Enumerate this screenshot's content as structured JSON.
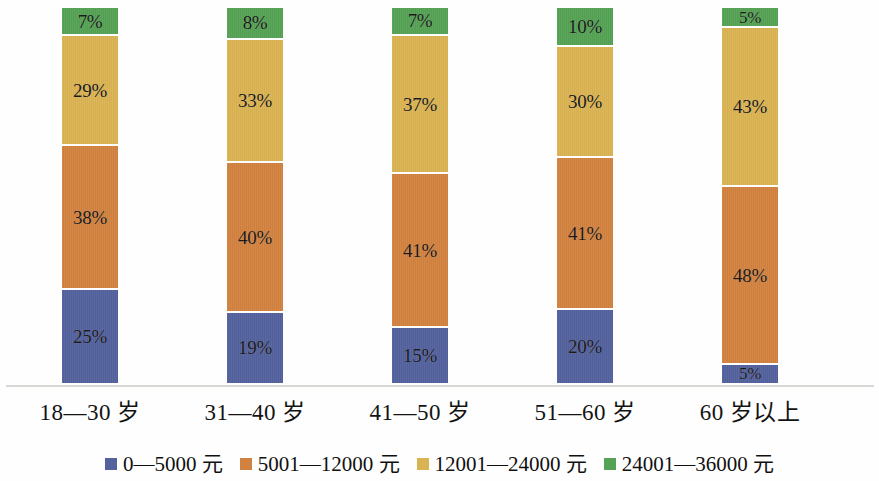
{
  "chart_data": {
    "type": "bar",
    "subtype": "stacked-bar-100",
    "title": "",
    "subtitle": "",
    "xlabel": "",
    "ylabel": "",
    "ylim": [
      0,
      100
    ],
    "grid": false,
    "legend_position": "bottom",
    "orientation": "vertical",
    "value_suffix": "%",
    "categories": [
      "18—30 岁",
      "31—40 岁",
      "41—50 岁",
      "51—60 岁",
      "60 岁以上"
    ],
    "series": [
      {
        "name": "0—5000 元",
        "color": "#53619d",
        "values": [
          25,
          19,
          15,
          20,
          5
        ],
        "labels": [
          "25%",
          "19%",
          "15%",
          "20%",
          "5%"
        ]
      },
      {
        "name": "5001—12000 元",
        "color": "#d2823f",
        "values": [
          38,
          40,
          41,
          41,
          48
        ],
        "labels": [
          "38%",
          "40%",
          "41%",
          "41%",
          "48%"
        ]
      },
      {
        "name": "12001—24000 元",
        "color": "#dab352",
        "values": [
          29,
          33,
          37,
          30,
          43
        ],
        "labels": [
          "29%",
          "33%",
          "37%",
          "30%",
          "43%"
        ]
      },
      {
        "name": "24001—36000 元",
        "color": "#55a254",
        "values": [
          7,
          8,
          7,
          10,
          5
        ],
        "labels": [
          "7%",
          "8%",
          "7%",
          "10%",
          "5%"
        ]
      }
    ]
  },
  "legend": {
    "items": [
      {
        "label": "0—5000 元",
        "color": "#53619d",
        "swatch_name": "legend-swatch-income-0-5000"
      },
      {
        "label": "5001—12000 元",
        "color": "#d2823f",
        "swatch_name": "legend-swatch-income-5001-12000"
      },
      {
        "label": "12001—24000 元",
        "color": "#dab352",
        "swatch_name": "legend-swatch-income-12001-24000"
      },
      {
        "label": "24001—36000 元",
        "color": "#55a254",
        "swatch_name": "legend-swatch-income-24001-36000"
      }
    ]
  },
  "axis": {
    "category_labels": [
      "18—30 岁",
      "31—40 岁",
      "41—50 岁",
      "51—60 岁",
      "60 岁以上"
    ],
    "line_color": "#d8d8d4"
  },
  "colors": {
    "background": "#fefefe",
    "series_blue": "#53619d",
    "series_orange": "#d2823f",
    "series_yellow": "#dab352",
    "series_green": "#55a254",
    "label_text": "#131313",
    "axis_line": "#d8d8d4"
  }
}
